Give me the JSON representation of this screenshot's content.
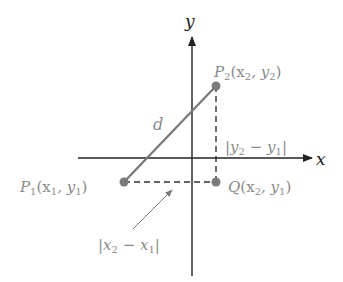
{
  "diagram": {
    "axes": {
      "x_label": "x",
      "y_label": "y"
    },
    "points": {
      "p2": {
        "name": "P",
        "sub": "2",
        "coords_label": "(x",
        "coord_x_sub": "2",
        "comma": ", y",
        "coord_y_sub": "2",
        "close": ")"
      },
      "p1": {
        "name": "P",
        "sub": "1",
        "coords_label": "(x",
        "coord_x_sub": "1",
        "comma": ", y",
        "coord_y_sub": "1",
        "close": ")"
      },
      "q": {
        "name": "Q",
        "coords_label": "(x",
        "coord_x_sub": "2",
        "comma": ", y",
        "coord_y_sub": "1",
        "close": ")"
      }
    },
    "segment_label": "d",
    "vertical_diff": {
      "open": "|y",
      "a_sub": "2",
      "minus": " − y",
      "b_sub": "1",
      "close": "|"
    },
    "horizontal_diff": {
      "open": "|x",
      "a_sub": "2",
      "minus": " − x",
      "b_sub": "1",
      "close": "|"
    },
    "colors": {
      "axis": "#222222",
      "point": "#7a7a7a",
      "segment": "#7a7a7a",
      "dashed": "#333333",
      "label": "#8a8a8a"
    }
  }
}
